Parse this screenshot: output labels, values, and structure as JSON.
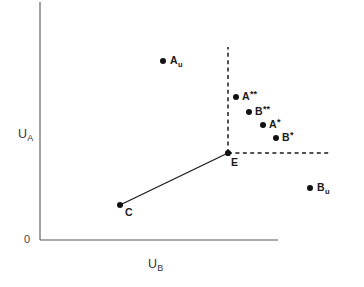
{
  "chart_data": {
    "type": "scatter",
    "title": "",
    "xlabel": "U_B",
    "ylabel": "U_A",
    "origin_label": "0",
    "grid": false,
    "legend": null,
    "xlim": [
      0,
      1
    ],
    "ylim": [
      0,
      1
    ],
    "axis_style": "L-shaped open axes, no tick marks, no numeric scale",
    "points": [
      {
        "id": "Au",
        "label_text": "A",
        "sub": "u",
        "sup": "",
        "x": 0.517,
        "y": 0.746,
        "px": 163,
        "py": 61,
        "label_dx": 7,
        "label_dy": -6
      },
      {
        "id": "A2s",
        "label_text": "A",
        "sub": "",
        "sup": "**",
        "x": 0.824,
        "y": 0.596,
        "px": 236,
        "py": 97,
        "label_dx": 6,
        "label_dy": -6
      },
      {
        "id": "B2s",
        "label_text": "B",
        "sub": "",
        "sup": "**",
        "x": 0.879,
        "y": 0.533,
        "px": 249,
        "py": 112,
        "label_dx": 6,
        "label_dy": -6
      },
      {
        "id": "A1s",
        "label_text": "A",
        "sub": "",
        "sup": "*",
        "x": 0.937,
        "y": 0.479,
        "px": 263,
        "py": 125,
        "label_dx": 6,
        "label_dy": -6
      },
      {
        "id": "B1s",
        "label_text": "B",
        "sub": "",
        "sup": "*",
        "x": 0.992,
        "y": 0.425,
        "px": 276,
        "py": 138,
        "label_dx": 6,
        "label_dy": -6
      },
      {
        "id": "E",
        "label_text": "E",
        "sub": "",
        "sup": "",
        "x": 0.79,
        "y": 0.363,
        "px": 228,
        "py": 153,
        "label_dx": 3,
        "label_dy": 4
      },
      {
        "id": "C",
        "label_text": "C",
        "sub": "",
        "sup": "",
        "x": 0.336,
        "y": 0.146,
        "px": 120,
        "py": 205,
        "label_dx": 5,
        "label_dy": 2
      },
      {
        "id": "Bu",
        "label_text": "B",
        "sub": "u",
        "sup": "",
        "x": 1.134,
        "y": 0.217,
        "px": 310,
        "py": 188,
        "label_dx": 7,
        "label_dy": -6
      }
    ],
    "segments": [
      {
        "id": "contract-curve",
        "style": "solid",
        "from": "C",
        "to": "E",
        "x1": 120,
        "y1": 205,
        "x2": 228,
        "y2": 153
      },
      {
        "id": "vertical-guide",
        "style": "dashed",
        "from": "E",
        "to": "top",
        "x1": 228,
        "y1": 153,
        "x2": 228,
        "y2": 47
      },
      {
        "id": "horizontal-guide",
        "style": "dashed",
        "from": "E",
        "to": "right",
        "x1": 228,
        "y1": 153,
        "x2": 331,
        "y2": 153
      }
    ],
    "axes": {
      "y_axis": {
        "x1": 40,
        "y1": 2,
        "x2": 40,
        "y2": 240
      },
      "x_axis": {
        "x1": 40,
        "y1": 240,
        "x2": 278,
        "y2": 240
      }
    },
    "colors": {
      "background": "#ffffff",
      "axis": "#555555",
      "ink": "#1a1a1a",
      "dot": "#121212"
    }
  },
  "labels": {
    "y_axis_main": "U",
    "y_axis_sub": "A",
    "x_axis_main": "U",
    "x_axis_sub": "B",
    "origin": "0"
  }
}
